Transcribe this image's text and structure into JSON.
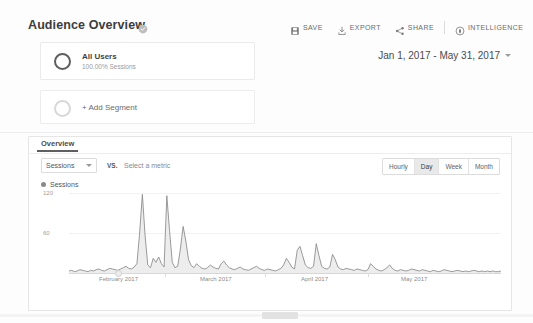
{
  "header": {
    "title": "Audience Overview",
    "verified_icon": "verified-badge-icon"
  },
  "toolbar": {
    "buttons": [
      {
        "label": "SAVE",
        "icon": "save-floppy-icon"
      },
      {
        "label": "EXPORT",
        "icon": "export-download-icon"
      },
      {
        "label": "SHARE",
        "icon": "share-nodes-icon"
      },
      {
        "label": "INTELLIGENCE",
        "icon": "intelligence-icon"
      }
    ]
  },
  "segments": {
    "all_users": {
      "name": "All Users",
      "subtitle": "100.00% Sessions"
    },
    "add_segment_label": "+ Add Segment"
  },
  "date_range": {
    "text": "Jan 1, 2017 - May 31, 2017",
    "caret_icon": "chevron-down-icon"
  },
  "panel": {
    "tab_label": "Overview",
    "metric_select": "Sessions",
    "metric_caret_icon": "chevron-down-icon",
    "vs_label": "VS.",
    "select_metric_placeholder": "Select a metric",
    "granularity": [
      {
        "label": "Hourly",
        "active": false
      },
      {
        "label": "Day",
        "active": true
      },
      {
        "label": "Week",
        "active": false
      },
      {
        "label": "Month",
        "active": false
      }
    ]
  },
  "chart_data": {
    "type": "area",
    "title": "Sessions",
    "series_name": "Sessions",
    "xlabel": "",
    "ylabel": "Sessions",
    "ylim": [
      0,
      120
    ],
    "yticks": [
      60,
      120
    ],
    "ytick_labels": [
      "60",
      "120"
    ],
    "grid": true,
    "legend": "top-left",
    "line_color": "#8a8a8a",
    "fill_color": "#eeeeee",
    "xticks": [
      "February 2017",
      "March 2017",
      "April 2017",
      "May 2017"
    ],
    "x_start": "Jan 1, 2017",
    "x_end": "May 31, 2017",
    "values": [
      3,
      4,
      2,
      3,
      5,
      4,
      3,
      2,
      4,
      3,
      5,
      6,
      4,
      3,
      5,
      7,
      6,
      5,
      4,
      6,
      8,
      10,
      7,
      6,
      9,
      14,
      60,
      118,
      56,
      12,
      8,
      22,
      16,
      24,
      14,
      9,
      116,
      64,
      16,
      8,
      10,
      36,
      70,
      48,
      20,
      11,
      8,
      14,
      10,
      7,
      6,
      8,
      12,
      9,
      7,
      6,
      14,
      18,
      12,
      8,
      6,
      5,
      7,
      9,
      6,
      5,
      4,
      6,
      8,
      10,
      7,
      5,
      4,
      6,
      5,
      4,
      3,
      5,
      7,
      12,
      22,
      16,
      9,
      6,
      34,
      40,
      26,
      12,
      8,
      7,
      10,
      44,
      26,
      10,
      7,
      6,
      9,
      28,
      20,
      9,
      6,
      5,
      7,
      6,
      5,
      4,
      6,
      5,
      4,
      3,
      5,
      14,
      10,
      6,
      4,
      3,
      5,
      8,
      12,
      7,
      4,
      3,
      5,
      4,
      3,
      4,
      6,
      5,
      4,
      3,
      5,
      4,
      3,
      2,
      4,
      3,
      2,
      3,
      5,
      4,
      3,
      2,
      3,
      4,
      3,
      2,
      3,
      2,
      3,
      4,
      3,
      2,
      3,
      2,
      3,
      2,
      3,
      2,
      2,
      3
    ]
  }
}
